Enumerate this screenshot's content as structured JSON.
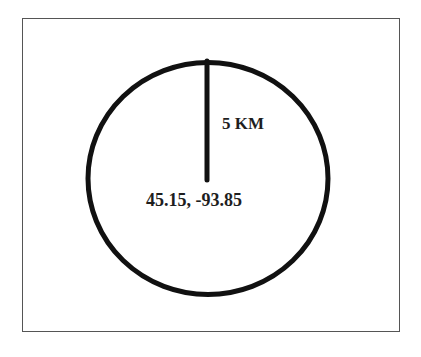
{
  "diagram": {
    "title": "",
    "radius_label": "5 KM",
    "center_label": "45.15, -93.85",
    "center": {
      "lat": 45.15,
      "lon": -93.85
    },
    "radius": {
      "value": 5,
      "unit": "KM"
    },
    "colors": {
      "stroke": "#111111",
      "text": "#1e1e1e",
      "frame": "#555555",
      "background": "#ffffff"
    }
  }
}
